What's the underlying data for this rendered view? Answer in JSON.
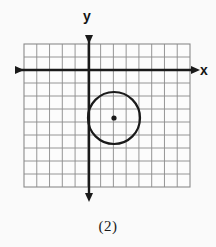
{
  "figure": {
    "caption": "(2)",
    "background_color": "#fafafa"
  },
  "axes": {
    "x_label": "x",
    "y_label": "y",
    "axis_color": "#1a1a1a",
    "x_axis_pixel_y": 70,
    "y_axis_pixel_x": 89,
    "x_axis_arrow_left_x": 8,
    "x_axis_arrow_right_x": 199,
    "y_axis_arrow_top_y": 28,
    "y_axis_arrow_bottom_y": 201
  },
  "grid": {
    "color": "#8a8a8a",
    "fill_color": "#fcfcfc",
    "cell_size": 12.75,
    "left": 24,
    "top": 44,
    "right": 190,
    "bottom": 187,
    "columns": 13,
    "rows": 11
  },
  "chart_data": {
    "type": "scatter",
    "title": "",
    "xlabel": "x",
    "ylabel": "y",
    "grid": true,
    "legend": null,
    "xlim": [
      -5.1,
      7.9
    ],
    "ylim": [
      -9.2,
      2.0
    ],
    "shapes": [
      {
        "kind": "circle",
        "center_x": 2.0,
        "center_y": -3.75,
        "radius": 2.0,
        "center_pixel_x": 114,
        "center_pixel_y": 118,
        "radius_pixel": 26,
        "stroke": "#1a1a1a",
        "stroke_width": 2.2,
        "fill": "none"
      }
    ],
    "points": [
      {
        "label": "circle-center",
        "x": 2.0,
        "y": -3.75,
        "pixel_x": 114,
        "pixel_y": 118,
        "color": "#1a1a1a",
        "radius_pixel": 2.6
      }
    ]
  }
}
